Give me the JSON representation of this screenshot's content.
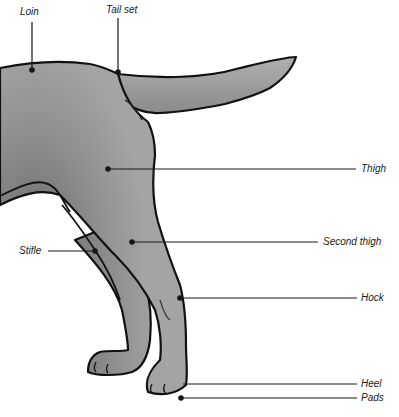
{
  "diagram": {
    "colors": {
      "body_fill": "#9a9a9a",
      "body_shade": "#6e6e6e",
      "outline": "#111111",
      "leader": "#1a1a1a",
      "background": "#ffffff"
    },
    "labels": [
      {
        "id": "loin",
        "text": "Loin"
      },
      {
        "id": "tail_set",
        "text": "Tail set"
      },
      {
        "id": "thigh",
        "text": "Thigh"
      },
      {
        "id": "stifle",
        "text": "Stifle"
      },
      {
        "id": "second_thigh",
        "text": "Second thigh"
      },
      {
        "id": "hock",
        "text": "Hock"
      },
      {
        "id": "heel",
        "text": "Heel"
      },
      {
        "id": "pads",
        "text": "Pads"
      }
    ]
  }
}
